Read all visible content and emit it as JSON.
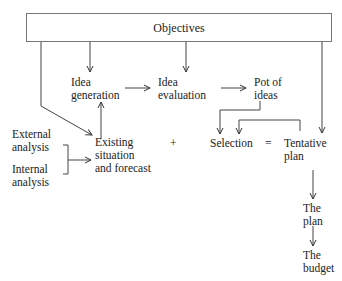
{
  "diagram": {
    "objectives": "Objectives",
    "nodes": {
      "idea_generation": [
        "Idea",
        "generation"
      ],
      "idea_evaluation": [
        "Idea",
        "evaluation"
      ],
      "pot_of_ideas": [
        "Pot of",
        "ideas"
      ],
      "external_analysis": [
        "External",
        "analysis"
      ],
      "internal_analysis": [
        "Internal",
        "analysis"
      ],
      "existing_situation": [
        "Existing",
        "situation",
        "and forecast"
      ],
      "selection": "Selection",
      "tentative_plan": [
        "Tentative",
        "plan"
      ],
      "the_plan": [
        "The",
        "plan"
      ],
      "the_budget": [
        "The",
        "budget"
      ]
    },
    "operators": {
      "plus": "+",
      "equals": "="
    },
    "edges": [
      {
        "from": "objectives",
        "to": "idea_generation"
      },
      {
        "from": "objectives",
        "to": "idea_evaluation"
      },
      {
        "from": "objectives",
        "to": "existing_situation"
      },
      {
        "from": "objectives",
        "to": "tentative_plan"
      },
      {
        "from": "idea_generation",
        "to": "idea_evaluation"
      },
      {
        "from": "idea_evaluation",
        "to": "pot_of_ideas"
      },
      {
        "from": "pot_of_ideas",
        "to": "selection"
      },
      {
        "from": "tentative_plan",
        "to": "selection"
      },
      {
        "from": "existing_situation",
        "to": "idea_generation"
      },
      {
        "from": "external_analysis",
        "to": "existing_situation"
      },
      {
        "from": "internal_analysis",
        "to": "existing_situation"
      },
      {
        "from": "tentative_plan",
        "to": "the_plan"
      },
      {
        "from": "the_plan",
        "to": "the_budget"
      }
    ]
  }
}
